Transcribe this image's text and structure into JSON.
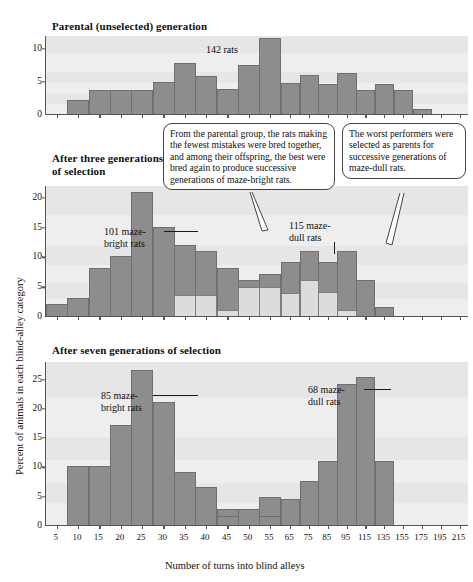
{
  "axes": {
    "y_title": "Percent of animals in each blind-alley category",
    "x_title": "Number of turns into blind alleys"
  },
  "callouts": [
    {
      "id": "bright-callout",
      "text": "From the parental group, the rats making the fewest mistakes were bred together, and among their offspring, the best were bred again to produce successive generations of maze-bright rats."
    },
    {
      "id": "dull-callout",
      "text": "The worst performers were selected as parents for successive generations of maze-dull rats."
    }
  ],
  "chart_data": [
    {
      "type": "bar",
      "title": "Parental (unselected) generation",
      "xlabel": "Number of turns into blind alleys",
      "ylabel": "Percent of animals in each blind-alley category",
      "ylim": [
        0,
        12
      ],
      "yticks": [
        0,
        5,
        10
      ],
      "grid": false,
      "annotations": [
        {
          "text": "142 rats",
          "at_category": "50"
        }
      ],
      "categories": [
        "5",
        "10",
        "15",
        "20",
        "25",
        "30",
        "35",
        "40",
        "45",
        "50",
        "55",
        "65",
        "75",
        "85",
        "95",
        "115",
        "135",
        "155",
        "175",
        "195",
        "215"
      ],
      "series": [
        {
          "name": "Parental generation",
          "color": "#8d8d8d",
          "values": [
            0,
            2.1,
            3.6,
            3.6,
            3.6,
            4.8,
            7.7,
            5.7,
            3.8,
            7.5,
            11.5,
            4.7,
            6.0,
            4.6,
            6.2,
            3.6,
            4.5,
            3.6,
            0.7,
            0,
            0
          ]
        }
      ]
    },
    {
      "type": "bar",
      "title": "After three generations\nof selection",
      "xlabel": "Number of turns into blind alleys",
      "ylabel": "Percent of animals in each blind-alley category",
      "ylim": [
        0,
        22
      ],
      "yticks": [
        0,
        5,
        10,
        15,
        20
      ],
      "grid": false,
      "annotations": [
        {
          "text": "101 maze-\nbright rats",
          "at_category": "25"
        },
        {
          "text": "115 maze-\ndull rats",
          "at_category": "95"
        }
      ],
      "categories": [
        "5",
        "10",
        "15",
        "20",
        "25",
        "30",
        "35",
        "40",
        "45",
        "50",
        "55",
        "65",
        "75",
        "85",
        "95",
        "115",
        "135",
        "155",
        "175",
        "195",
        "215"
      ],
      "series": [
        {
          "name": "101 maze-bright rats",
          "color": "#8d8d8d",
          "values": [
            2.0,
            3.0,
            8.0,
            10.0,
            20.8,
            15.0,
            12.0,
            11.0,
            8.0,
            6.0,
            7.0,
            9.0,
            11.0,
            9.0,
            11.0,
            6.0,
            1.5,
            0,
            0,
            0,
            0
          ]
        },
        {
          "name": "115 maze-dull rats",
          "color": "#dcdcdc",
          "values": [
            0,
            0,
            0,
            0,
            0,
            0,
            3.6,
            3.6,
            1.0,
            4.8,
            4.8,
            3.8,
            6.0,
            4.0,
            1.0,
            0,
            0,
            0,
            0,
            0,
            0
          ]
        }
      ]
    },
    {
      "type": "bar",
      "title": "After seven generations of selection",
      "xlabel": "Number of turns into blind alleys",
      "ylabel": "Percent of animals in each blind-alley category",
      "ylim": [
        0,
        28
      ],
      "yticks": [
        0,
        5,
        10,
        15,
        20,
        25
      ],
      "grid": false,
      "annotations": [
        {
          "text": "85 maze-\nbright rats",
          "at_category": "20"
        },
        {
          "text": "68 maze-\ndull rats",
          "at_category": "115"
        }
      ],
      "categories": [
        "5",
        "10",
        "15",
        "20",
        "25",
        "30",
        "35",
        "40",
        "45",
        "50",
        "55",
        "65",
        "75",
        "85",
        "95",
        "115",
        "135",
        "155",
        "175",
        "195",
        "215"
      ],
      "series": [
        {
          "name": "85 maze-bright rats",
          "color": "#8d8d8d",
          "values": [
            0,
            10.0,
            10.0,
            17.0,
            26.5,
            21.0,
            9.0,
            6.5,
            2.8,
            2.8,
            4.7,
            0.7,
            0.7,
            2.2,
            0,
            0,
            0,
            0,
            0,
            0,
            0
          ]
        },
        {
          "name": "68 maze-dull rats",
          "color": "#8d8d8d",
          "values": [
            0,
            0,
            0,
            0,
            0,
            0,
            0,
            0,
            1.5,
            0,
            1.5,
            4.5,
            7.5,
            11.0,
            24.0,
            25.2,
            11.0,
            0,
            0,
            0,
            0
          ]
        }
      ]
    }
  ]
}
